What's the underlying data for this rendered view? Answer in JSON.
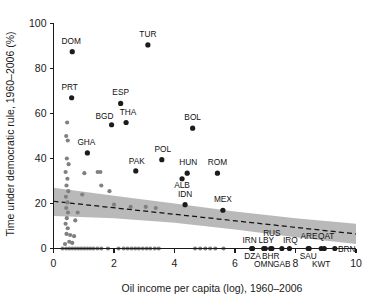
{
  "chart_data": {
    "type": "scatter",
    "title": "",
    "xlabel": "Oil income per capita (log), 1960–2006",
    "ylabel": "Time under democratic rule, 1960–2006 (%)",
    "xlim": [
      0,
      10
    ],
    "ylim": [
      0,
      100
    ],
    "xticks": [
      "0",
      "2",
      "4",
      "6",
      "8",
      "10"
    ],
    "xtick_values": [
      0,
      2,
      4,
      6,
      8,
      10
    ],
    "yticks": [
      "0",
      "20",
      "40",
      "60",
      "80",
      "100"
    ],
    "ytick_values": [
      0,
      20,
      40,
      60,
      80,
      100
    ],
    "grid": false,
    "legend": "none",
    "series": [
      {
        "name": "labeled countries",
        "marker": "filled-circle-dark",
        "points": [
          {
            "label": "DOM",
            "x": 0.62,
            "y": 87.5,
            "label_dx": -1,
            "label_dy": -8
          },
          {
            "label": "TUR",
            "x": 3.12,
            "y": 90.5,
            "label_dx": 0,
            "label_dy": -8
          },
          {
            "label": "PRT",
            "x": 0.6,
            "y": 67.0,
            "label_dx": -2,
            "label_dy": -8
          },
          {
            "label": "ESP",
            "x": 2.22,
            "y": 64.5,
            "label_dx": 0,
            "label_dy": -8
          },
          {
            "label": "BGD",
            "x": 1.92,
            "y": 55.0,
            "label_dx": -7,
            "label_dy": -6
          },
          {
            "label": "THA",
            "x": 2.4,
            "y": 56.0,
            "label_dx": 2,
            "label_dy": -8
          },
          {
            "label": "BOL",
            "x": 4.6,
            "y": 53.5,
            "label_dx": 0,
            "label_dy": -8
          },
          {
            "label": "GHA",
            "x": 1.12,
            "y": 42.5,
            "label_dx": -1,
            "label_dy": -8
          },
          {
            "label": "POL",
            "x": 3.58,
            "y": 39.5,
            "label_dx": 1,
            "label_dy": -8
          },
          {
            "label": "PAK",
            "x": 2.72,
            "y": 34.5,
            "label_dx": 1,
            "label_dy": -7
          },
          {
            "label": "HUN",
            "x": 4.42,
            "y": 33.5,
            "label_dx": 1,
            "label_dy": -8
          },
          {
            "label": "ROM",
            "x": 5.42,
            "y": 33.5,
            "label_dx": 0,
            "label_dy": -8
          },
          {
            "label": "ALB",
            "x": 4.25,
            "y": 31.0,
            "label_dx": 0,
            "label_dy": 9
          },
          {
            "label": "IDN",
            "x": 4.35,
            "y": 19.5,
            "label_dx": 0,
            "label_dy": -8
          },
          {
            "label": "MEX",
            "x": 5.6,
            "y": 17.0,
            "label_dx": 0,
            "label_dy": -8
          },
          {
            "label": "RUS",
            "x": 7.22,
            "y": 0.0,
            "label_dx": 0,
            "label_dy": -13
          },
          {
            "label": "IRN",
            "x": 6.55,
            "y": 0.0,
            "label_dx": -2,
            "label_dy": -6
          },
          {
            "label": "LBY",
            "x": 7.0,
            "y": 0.0,
            "label_dx": 1,
            "label_dy": -6
          },
          {
            "label": "IRQ",
            "x": 7.8,
            "y": 0.0,
            "label_dx": 1,
            "label_dy": -6
          },
          {
            "label": "ARE",
            "x": 8.45,
            "y": 0.0,
            "label_dx": 0,
            "label_dy": -10
          },
          {
            "label": "QAT",
            "x": 8.95,
            "y": 0.0,
            "label_dx": 2,
            "label_dy": -10
          },
          {
            "label": "BRN",
            "x": 9.3,
            "y": 0.0,
            "label_dx": 12,
            "label_dy": 3
          },
          {
            "label": "DZA",
            "x": 6.58,
            "y": 0.0,
            "label_dx": 0,
            "label_dy": 10
          },
          {
            "label": "BHR",
            "x": 7.18,
            "y": 0.0,
            "label_dx": 0,
            "label_dy": 10
          },
          {
            "label": "SAU",
            "x": 8.42,
            "y": 0.0,
            "label_dx": 0,
            "label_dy": 10
          },
          {
            "label": "OMN",
            "x": 6.95,
            "y": 0.0,
            "label_dx": 0,
            "label_dy": 18
          },
          {
            "label": "GAB",
            "x": 7.55,
            "y": 0.0,
            "label_dx": 0,
            "label_dy": 18
          },
          {
            "label": "KWT",
            "x": 8.85,
            "y": 0.0,
            "label_dx": 0,
            "label_dy": 18
          }
        ]
      },
      {
        "name": "unlabeled countries",
        "marker": "filled-circle-gray",
        "points_xy": [
          [
            0.45,
            56.0
          ],
          [
            0.42,
            50.0
          ],
          [
            0.47,
            48.0
          ],
          [
            0.44,
            40.0
          ],
          [
            0.5,
            37.5
          ],
          [
            0.4,
            34.0
          ],
          [
            0.46,
            31.0
          ],
          [
            0.43,
            28.0
          ],
          [
            0.49,
            25.5
          ],
          [
            0.41,
            23.0
          ],
          [
            0.46,
            20.5
          ],
          [
            0.42,
            18.0
          ],
          [
            0.48,
            16.0
          ],
          [
            0.44,
            13.5
          ],
          [
            0.4,
            11.0
          ],
          [
            0.47,
            9.0
          ],
          [
            0.43,
            6.5
          ],
          [
            0.52,
            3.0
          ],
          [
            0.38,
            2.0
          ],
          [
            1.02,
            33.5
          ],
          [
            1.46,
            34.0
          ],
          [
            1.55,
            34.0
          ],
          [
            1.85,
            25.5
          ],
          [
            2.0,
            19.5
          ],
          [
            1.58,
            28.0
          ],
          [
            0.95,
            24.0
          ],
          [
            0.8,
            16.0
          ],
          [
            0.72,
            12.5
          ],
          [
            2.55,
            18.5
          ],
          [
            3.05,
            18.5
          ],
          [
            3.38,
            18.0
          ],
          [
            0.3,
            0.0
          ],
          [
            0.42,
            0.0
          ],
          [
            0.52,
            0.0
          ],
          [
            0.62,
            0.0
          ],
          [
            0.72,
            0.0
          ],
          [
            0.82,
            0.0
          ],
          [
            0.92,
            0.0
          ],
          [
            1.02,
            0.0
          ],
          [
            1.12,
            0.0
          ],
          [
            1.22,
            0.0
          ],
          [
            1.32,
            0.0
          ],
          [
            1.45,
            0.0
          ],
          [
            1.58,
            0.0
          ],
          [
            1.8,
            0.0
          ],
          [
            2.15,
            0.0
          ],
          [
            2.32,
            0.0
          ],
          [
            2.45,
            0.0
          ],
          [
            2.58,
            0.0
          ],
          [
            2.7,
            0.0
          ],
          [
            2.82,
            0.0
          ],
          [
            2.95,
            0.0
          ],
          [
            3.08,
            0.0
          ],
          [
            3.2,
            0.0
          ],
          [
            3.35,
            0.0
          ],
          [
            3.48,
            0.0
          ],
          [
            4.68,
            0.0
          ],
          [
            4.85,
            0.0
          ],
          [
            5.02,
            0.0
          ],
          [
            5.18,
            0.0
          ],
          [
            5.35,
            0.0
          ],
          [
            5.62,
            0.0
          ],
          [
            0.55,
            6.0
          ],
          [
            0.68,
            5.5
          ],
          [
            0.62,
            2.5
          ]
        ]
      }
    ],
    "fit_line": {
      "style": "dashed",
      "x0": 0.0,
      "y0": 21.0,
      "x1": 10.0,
      "y1": 6.5
    },
    "confidence_band": {
      "shade": "gray",
      "upper": [
        [
          0.0,
          27.0
        ],
        [
          2.0,
          23.5
        ],
        [
          4.0,
          20.0
        ],
        [
          6.0,
          16.5
        ],
        [
          8.0,
          13.5
        ],
        [
          10.0,
          11.0
        ]
      ],
      "lower": [
        [
          0.0,
          14.5
        ],
        [
          2.0,
          13.5
        ],
        [
          4.0,
          11.5
        ],
        [
          6.0,
          8.5
        ],
        [
          8.0,
          5.0
        ],
        [
          10.0,
          2.0
        ]
      ]
    }
  }
}
